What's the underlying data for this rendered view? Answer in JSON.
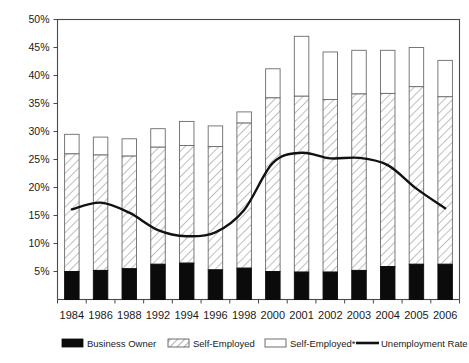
{
  "chart_data": {
    "type": "bar",
    "title": "",
    "subtitle": "",
    "xlabel": "",
    "ylabel": "",
    "ylim": [
      0,
      50
    ],
    "ytick_labels": [
      "5%",
      "10%",
      "15%",
      "20%",
      "25%",
      "30%",
      "35%",
      "40%",
      "45%",
      "50%"
    ],
    "ytick_values": [
      5,
      10,
      15,
      20,
      25,
      30,
      35,
      40,
      45,
      50
    ],
    "grid": false,
    "legend_position": "bottom",
    "stacked": true,
    "categories": [
      "1984",
      "1986",
      "1988",
      "1992",
      "1994",
      "1996",
      "1998",
      "2000",
      "2001",
      "2002",
      "2003",
      "2004",
      "2005",
      "2006"
    ],
    "series": [
      {
        "name": "Business Owner",
        "kind": "bar-segment",
        "fill": "solid-black",
        "color": "#0b0b0b",
        "values": [
          5.0,
          5.2,
          5.5,
          6.3,
          6.5,
          5.3,
          5.6,
          5.0,
          4.9,
          4.9,
          5.2,
          5.9,
          6.3,
          6.3
        ]
      },
      {
        "name": "Self-Employed",
        "kind": "bar-segment",
        "fill": "diagonal-hatch",
        "color": "#ffffff",
        "values": [
          21.0,
          20.6,
          20.1,
          20.9,
          21.0,
          22.0,
          25.9,
          31.0,
          31.4,
          30.8,
          31.5,
          30.9,
          31.7,
          29.9
        ]
      },
      {
        "name": "Self-Employed*",
        "kind": "bar-segment",
        "fill": "empty-white",
        "color": "#ffffff",
        "values": [
          3.5,
          3.2,
          3.1,
          3.3,
          4.3,
          3.7,
          2.0,
          5.2,
          10.7,
          8.5,
          7.8,
          7.7,
          7.0,
          6.5
        ]
      },
      {
        "name": "Unemployment Rate",
        "kind": "line",
        "color": "#111111",
        "values": [
          16.1,
          17.3,
          15.5,
          12.4,
          11.3,
          12.0,
          16.0,
          24.4,
          26.2,
          25.2,
          25.3,
          24.0,
          19.8,
          16.3
        ]
      }
    ],
    "stack_totals": [
      29.5,
      29.0,
      28.7,
      30.5,
      31.8,
      31.0,
      33.5,
      41.2,
      47.0,
      44.2,
      44.5,
      44.5,
      45.0,
      42.7
    ]
  },
  "legend": {
    "items": [
      {
        "label": "Business Owner",
        "swatch": "solid-black-swatch"
      },
      {
        "label": "Self-Employed",
        "swatch": "hatched-swatch"
      },
      {
        "label": "Self-Employed*",
        "swatch": "empty-swatch"
      },
      {
        "label": "Unemployment Rate",
        "swatch": "line-swatch"
      }
    ]
  }
}
